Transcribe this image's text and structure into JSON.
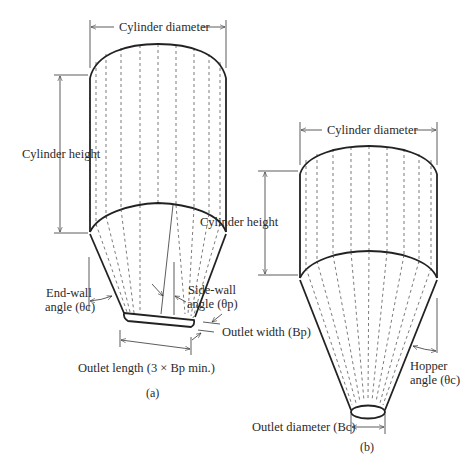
{
  "figure_a": {
    "label": "(a)",
    "cylinder_diameter": "Cylinder diameter",
    "cylinder_height": "Cylinder height",
    "end_wall_line1": "End-wall",
    "end_wall_line2": "angle (θc)",
    "side_wall_line1": "Side-wall",
    "side_wall_line2": "angle (θp)",
    "outlet_width": "Outlet width (Bp)",
    "outlet_length": "Outlet length (3 × Bp min.)"
  },
  "figure_b": {
    "label": "(b)",
    "cylinder_diameter": "Cylinder diameter",
    "cylinder_height": "Cylinder height",
    "hopper_line1": "Hopper",
    "hopper_line2": "angle (θc)",
    "outlet_diameter": "Outlet diameter (Bc)"
  }
}
